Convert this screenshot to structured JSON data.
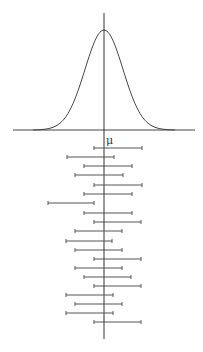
{
  "diagram": {
    "title": "",
    "mean_label": "μ",
    "mean_x": 104,
    "colors": {
      "line": "#444444",
      "interval": "#555555",
      "background": "#ffffff"
    },
    "curve": {
      "type": "normal-distribution",
      "baseline_y": 130,
      "peak_y": 30,
      "x_min": 13,
      "x_max": 195,
      "sigma_px": 19
    },
    "intervals": [
      {
        "y": 148,
        "lo": 94,
        "hi": 142
      },
      {
        "y": 157,
        "lo": 67,
        "hi": 114
      },
      {
        "y": 166,
        "lo": 84,
        "hi": 132
      },
      {
        "y": 175,
        "lo": 75,
        "hi": 123
      },
      {
        "y": 185,
        "lo": 94,
        "hi": 142
      },
      {
        "y": 194,
        "lo": 84,
        "hi": 132
      },
      {
        "y": 203,
        "lo": 48,
        "hi": 94
      },
      {
        "y": 213,
        "lo": 84,
        "hi": 132
      },
      {
        "y": 222,
        "lo": 94,
        "hi": 141
      },
      {
        "y": 231,
        "lo": 75,
        "hi": 122
      },
      {
        "y": 241,
        "lo": 66,
        "hi": 112
      },
      {
        "y": 250,
        "lo": 75,
        "hi": 122
      },
      {
        "y": 259,
        "lo": 94,
        "hi": 141
      },
      {
        "y": 268,
        "lo": 75,
        "hi": 122
      },
      {
        "y": 277,
        "lo": 84,
        "hi": 131
      },
      {
        "y": 286,
        "lo": 94,
        "hi": 141
      },
      {
        "y": 295,
        "lo": 66,
        "hi": 113
      },
      {
        "y": 304,
        "lo": 75,
        "hi": 122
      },
      {
        "y": 313,
        "lo": 66,
        "hi": 113
      },
      {
        "y": 322,
        "lo": 94,
        "hi": 141
      }
    ]
  }
}
